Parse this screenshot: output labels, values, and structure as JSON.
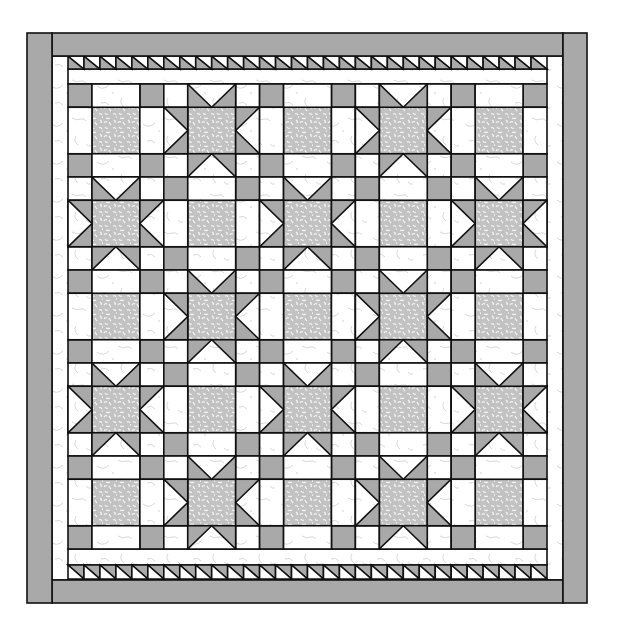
{
  "canvas": {
    "width": 619,
    "height": 631,
    "background": "#ffffff"
  },
  "colors": {
    "solid_gray": "#a9a9a9",
    "speckle_base": "#c2c2c2",
    "speckle_mark": "#f4f4f4",
    "white_fabric": "#ffffff",
    "white_squiggle": "#d2d2d2",
    "outline": "#111111"
  },
  "quilt": {
    "outer_border": {
      "left": {
        "x": 27,
        "y": 33,
        "w": 25,
        "h": 570
      },
      "right": {
        "x": 563,
        "y": 33,
        "w": 24,
        "h": 570
      },
      "top": {
        "x": 52,
        "y": 33,
        "w": 511,
        "h": 23
      },
      "bottom": {
        "x": 52,
        "y": 580,
        "w": 511,
        "h": 23
      }
    },
    "inner_white_border": {
      "x": 52,
      "y": 56,
      "w": 511,
      "h": 524
    },
    "sawtooth": {
      "count": 30,
      "top": {
        "x": 68,
        "y": 56,
        "w": 479,
        "h": 13,
        "gray_side": "lower-left"
      },
      "bottom": {
        "x": 68,
        "y": 565,
        "w": 479,
        "h": 14,
        "gray_side": "upper-right"
      }
    },
    "spacer_strips": {
      "top": {
        "x": 68,
        "y": 69,
        "w": 479,
        "h": 15
      },
      "bottom": {
        "x": 68,
        "y": 549,
        "w": 479,
        "h": 16
      }
    },
    "block_grid": {
      "x": 68,
      "y": 84,
      "w": 479,
      "h": 465,
      "rows": 5,
      "cols": 5,
      "unit_ratio": [
        1,
        2,
        1
      ],
      "layout": [
        [
          "plain",
          "star",
          "plain",
          "star",
          "plain"
        ],
        [
          "star",
          "plain",
          "star",
          "plain",
          "star"
        ],
        [
          "plain",
          "star",
          "plain",
          "star",
          "plain"
        ],
        [
          "star",
          "plain",
          "star",
          "plain",
          "star"
        ],
        [
          "plain",
          "star",
          "plain",
          "star",
          "plain"
        ]
      ]
    },
    "block_types": {
      "plain": {
        "label": "Nine-patch block",
        "corners": "solid_gray",
        "edges": "white_fabric",
        "center": "speckle"
      },
      "star": {
        "label": "Sawtooth star block",
        "corners": "white_fabric",
        "edges": "flying_geese_inward",
        "center": "speckle"
      }
    }
  }
}
